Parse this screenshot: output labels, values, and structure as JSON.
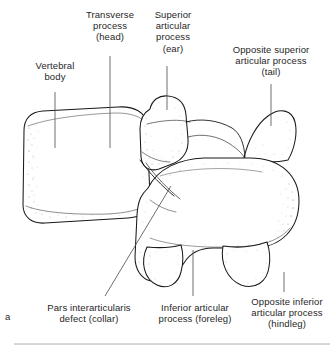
{
  "figure": {
    "panel_letter": "a",
    "caption_subject": "Lateral oblique vertebra - Scotty dog sign"
  },
  "labels": {
    "vertebral_body": "Vertebral\nbody",
    "transverse_process": "Transverse\nprocess\n(head)",
    "superior_articular_process": "Superior\narticular\nprocess\n(ear)",
    "opposite_superior_articular_process": "Opposite superior\narticular process\n(tail)",
    "pars_interarticularis_defect": "Pars interarticularis\ndefect (collar)",
    "inferior_articular_process": "Inferior articular\nprocess (foreleg)",
    "opposite_inferior_articular_process": "Opposite inferior\narticular process\n(hindleg)"
  },
  "colors": {
    "outline": "#1a1a1a",
    "leader": "#555555",
    "stipple": "#6a6a6a",
    "text": "#1f1f1f",
    "background": "#ffffff"
  }
}
